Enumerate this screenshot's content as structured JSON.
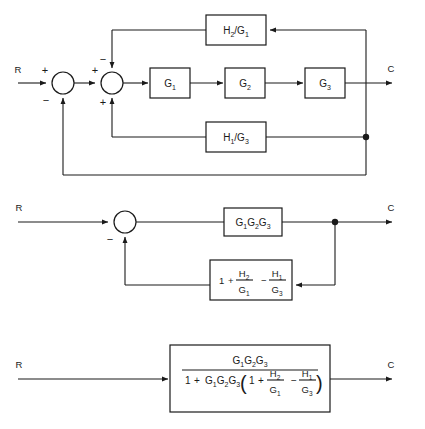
{
  "figure": {
    "type": "block-diagram",
    "diagrams": [
      {
        "id": "original",
        "input_label": "R",
        "output_label": "C",
        "summing_junctions": [
          {
            "id": "sum1",
            "signs": {
              "left": "+",
              "bottom": "−"
            }
          },
          {
            "id": "sum2",
            "signs": {
              "left": "+",
              "top": "−",
              "bottom": "+"
            }
          }
        ],
        "forward_blocks": [
          {
            "id": "g1",
            "num": "G",
            "sub": "1"
          },
          {
            "id": "g2",
            "num": "G",
            "sub": "2"
          },
          {
            "id": "g3",
            "num": "G",
            "sub": "3"
          }
        ],
        "feedback_blocks": [
          {
            "id": "h2g1",
            "n1": "H",
            "s1": "2",
            "slash": "/",
            "n2": "G",
            "s2": "1"
          },
          {
            "id": "h1g3",
            "n1": "H",
            "s1": "1",
            "slash": "/",
            "n2": "G",
            "s2": "3"
          }
        ]
      },
      {
        "id": "reduced",
        "input_label": "R",
        "output_label": "C",
        "summing_junctions": [
          {
            "id": "sum1",
            "signs": {
              "bottom": "−"
            }
          }
        ],
        "forward_block": {
          "id": "g1g2g3",
          "terms": [
            {
              "n": "G",
              "s": "1"
            },
            {
              "n": "G",
              "s": "2"
            },
            {
              "n": "G",
              "s": "3"
            }
          ]
        },
        "feedback_block": {
          "id": "feedback-expr",
          "one": "1",
          "plus": "+",
          "minus": "−",
          "frac1": {
            "num": "H",
            "num_sub": "2",
            "den": "G",
            "den_sub": "1"
          },
          "frac2": {
            "num": "H",
            "num_sub": "1",
            "den": "G",
            "den_sub": "3"
          }
        }
      },
      {
        "id": "closed-loop",
        "input_label": "R",
        "output_label": "C",
        "transfer_function": {
          "id": "closed-loop-tf",
          "numerator": {
            "terms": [
              {
                "n": "G",
                "s": "1"
              },
              {
                "n": "G",
                "s": "2"
              },
              {
                "n": "G",
                "s": "3"
              }
            ]
          },
          "denominator": {
            "one": "1",
            "plus": "+",
            "minus": "−",
            "gain_terms": [
              {
                "n": "G",
                "s": "1"
              },
              {
                "n": "G",
                "s": "2"
              },
              {
                "n": "G",
                "s": "3"
              }
            ],
            "paren_open": "(",
            "paren_close": ")",
            "inner_one": "1",
            "frac1": {
              "num": "H",
              "num_sub": "2",
              "den": "G",
              "den_sub": "1"
            },
            "frac2": {
              "num": "H",
              "num_sub": "1",
              "den": "G",
              "den_sub": "3"
            }
          }
        }
      }
    ],
    "colors": {
      "line": "#1a1a1a",
      "background": "#ffffff",
      "box_fill": "#ffffff"
    }
  }
}
